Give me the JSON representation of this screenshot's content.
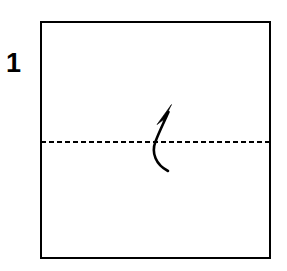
{
  "figure": {
    "kind": "origami-step-diagram",
    "canvas": {
      "width": 287,
      "height": 271,
      "background": "#ffffff"
    },
    "ink_color": "#000000"
  },
  "step": {
    "number": "1",
    "label_x": 8,
    "label_y": 53
  },
  "paper": {
    "shape": "square",
    "left": 40,
    "top": 21,
    "width": 231,
    "height": 238,
    "border_width": 2,
    "border_color": "#000000",
    "fill_color": "#ffffff"
  },
  "fold_line": {
    "style": "dashed",
    "meaning": "valley-fold-crease",
    "x1": 41,
    "y1": 142,
    "x2": 270,
    "y2": 142,
    "stroke_width": 2,
    "dash_length": 5,
    "gap_length": 3,
    "color": "#000000"
  },
  "fold_arrow": {
    "direction": "upward",
    "shape": "curved",
    "curve_path": "M 168 171 C 156 165 151 153 155.5 141.5 C 159 132 164.5 121 168.5 112",
    "stroke_width": 2.6,
    "color": "#000000",
    "head_points": "171.5,104.5 163.2,121.5 167.1,116.9 157.0,124.6",
    "tail_x": 168,
    "tail_y": 171,
    "tip_x": 171,
    "tip_y": 105
  }
}
